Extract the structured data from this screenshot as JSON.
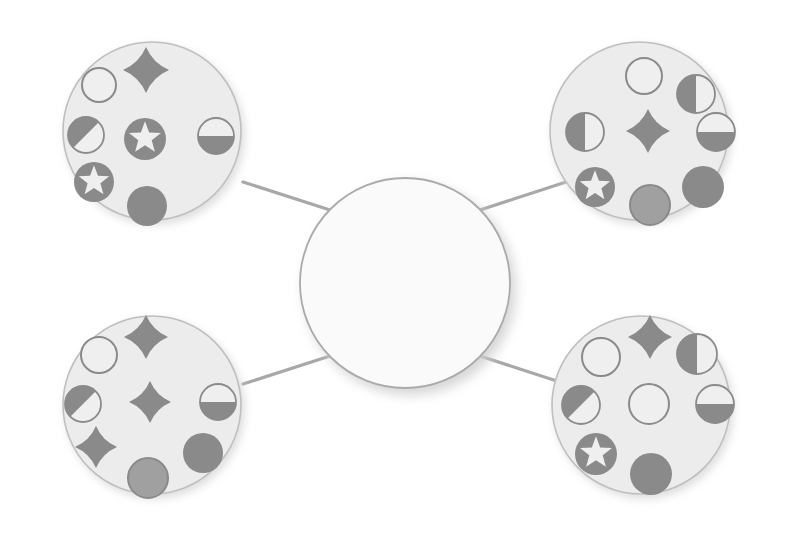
{
  "diagram": {
    "background_color": "#ffffff",
    "palette": {
      "cluster_fill": "#ececec",
      "cluster_stroke": "#bfbfbf",
      "hub_fill": "#fafafa",
      "hub_stroke": "#aaaaaa",
      "connector_stroke": "#a8a8a8",
      "glyph_dark": "#8a8a8a",
      "glyph_medium": "#a0a0a0",
      "glyph_light": "#efefef",
      "glyph_outline": "#8a8a8a",
      "shadow_color": "#e3e3e3"
    },
    "hub": {
      "label": "center-hub",
      "cx": 405,
      "cy": 283,
      "r": 105,
      "contents": "empty"
    },
    "connectors": [
      {
        "name": "connector-hub-to-top-left",
        "x1": 330,
        "y1": 210,
        "x2": 243,
        "y2": 182
      },
      {
        "name": "connector-hub-to-top-right",
        "x1": 480,
        "y1": 210,
        "x2": 566,
        "y2": 182
      },
      {
        "name": "connector-hub-to-bottom-left",
        "x1": 330,
        "y1": 356,
        "x2": 243,
        "y2": 384
      },
      {
        "name": "connector-hub-to-bottom-right",
        "x1": 480,
        "y1": 356,
        "x2": 566,
        "y2": 384
      }
    ],
    "clusters": [
      {
        "name": "cluster-top-left",
        "cx": 152,
        "cy": 131,
        "r": 89,
        "item_count": 7,
        "items": [
          {
            "glyph": "circle-outline-icon",
            "cx": 99,
            "cy": 85,
            "r": 17,
            "fill": "none",
            "shade": "light"
          },
          {
            "glyph": "four-pointed-star-icon",
            "cx": 146,
            "cy": 70,
            "r": 23,
            "fill": "solid",
            "shade": "dark"
          },
          {
            "glyph": "circle-half-diagonal-icon",
            "cx": 86,
            "cy": 135,
            "r": 18,
            "fill": "half-diagonal",
            "shade": "dark"
          },
          {
            "glyph": "star-in-circle-icon",
            "cx": 145,
            "cy": 139,
            "r": 21,
            "fill": "solid",
            "shade": "dark"
          },
          {
            "glyph": "circle-half-horizontal-icon",
            "cx": 216,
            "cy": 136,
            "r": 18,
            "fill": "half-bottom",
            "shade": "dark"
          },
          {
            "glyph": "star-in-circle-icon",
            "cx": 94,
            "cy": 182,
            "r": 20,
            "fill": "solid",
            "shade": "dark"
          },
          {
            "glyph": "circle-solid-icon",
            "cx": 147,
            "cy": 206,
            "r": 20,
            "fill": "solid",
            "shade": "dark"
          }
        ]
      },
      {
        "name": "cluster-top-right",
        "cx": 639,
        "cy": 131,
        "r": 89,
        "item_count": 7,
        "items": [
          {
            "glyph": "circle-outline-icon",
            "cx": 644,
            "cy": 76,
            "r": 18,
            "fill": "none",
            "shade": "light"
          },
          {
            "glyph": "circle-half-vertical-icon",
            "cx": 696,
            "cy": 94,
            "r": 19,
            "fill": "half-left",
            "shade": "dark"
          },
          {
            "glyph": "circle-half-vertical-icon",
            "cx": 585,
            "cy": 132,
            "r": 19,
            "fill": "half-left",
            "shade": "dark"
          },
          {
            "glyph": "four-pointed-star-icon",
            "cx": 648,
            "cy": 131,
            "r": 22,
            "fill": "solid",
            "shade": "dark"
          },
          {
            "glyph": "circle-half-horizontal-icon",
            "cx": 716,
            "cy": 132,
            "r": 19,
            "fill": "half-bottom",
            "shade": "dark"
          },
          {
            "glyph": "star-in-circle-icon",
            "cx": 595,
            "cy": 187,
            "r": 20,
            "fill": "solid",
            "shade": "dark"
          },
          {
            "glyph": "circle-solid-icon",
            "cx": 703,
            "cy": 187,
            "r": 21,
            "fill": "solid",
            "shade": "dark"
          },
          {
            "glyph": "circle-solid-outlined-icon",
            "cx": 650,
            "cy": 205,
            "r": 20,
            "fill": "solid",
            "shade": "medium"
          }
        ]
      },
      {
        "name": "cluster-bottom-left",
        "cx": 152,
        "cy": 405,
        "r": 89,
        "item_count": 7,
        "items": [
          {
            "glyph": "circle-outline-icon",
            "cx": 99,
            "cy": 355,
            "r": 18,
            "fill": "none",
            "shade": "light"
          },
          {
            "glyph": "four-pointed-star-icon",
            "cx": 146,
            "cy": 337,
            "r": 22,
            "fill": "solid",
            "shade": "dark"
          },
          {
            "glyph": "circle-half-diagonal-icon",
            "cx": 83,
            "cy": 404,
            "r": 18,
            "fill": "half-diagonal",
            "shade": "dark"
          },
          {
            "glyph": "four-pointed-star-icon",
            "cx": 150,
            "cy": 402,
            "r": 21,
            "fill": "solid",
            "shade": "dark"
          },
          {
            "glyph": "circle-half-horizontal-icon",
            "cx": 218,
            "cy": 402,
            "r": 18,
            "fill": "half-bottom",
            "shade": "dark"
          },
          {
            "glyph": "four-pointed-star-icon",
            "cx": 96,
            "cy": 447,
            "r": 21,
            "fill": "solid",
            "shade": "dark"
          },
          {
            "glyph": "circle-solid-icon",
            "cx": 203,
            "cy": 453,
            "r": 20,
            "fill": "solid",
            "shade": "dark"
          },
          {
            "glyph": "circle-solid-outlined-icon",
            "cx": 148,
            "cy": 478,
            "r": 20,
            "fill": "solid",
            "shade": "medium"
          }
        ]
      },
      {
        "name": "cluster-bottom-right",
        "cx": 641,
        "cy": 405,
        "r": 89,
        "item_count": 7,
        "items": [
          {
            "glyph": "circle-outline-icon",
            "cx": 601,
            "cy": 357,
            "r": 19,
            "fill": "none",
            "shade": "light"
          },
          {
            "glyph": "four-pointed-star-icon",
            "cx": 650,
            "cy": 337,
            "r": 22,
            "fill": "solid",
            "shade": "dark"
          },
          {
            "glyph": "circle-half-vertical-icon",
            "cx": 697,
            "cy": 354,
            "r": 20,
            "fill": "half-left",
            "shade": "dark"
          },
          {
            "glyph": "circle-half-diagonal-icon",
            "cx": 581,
            "cy": 405,
            "r": 19,
            "fill": "half-diagonal",
            "shade": "dark"
          },
          {
            "glyph": "circle-outline-icon",
            "cx": 649,
            "cy": 404,
            "r": 20,
            "fill": "none",
            "shade": "light"
          },
          {
            "glyph": "circle-half-horizontal-icon",
            "cx": 715,
            "cy": 404,
            "r": 19,
            "fill": "half-bottom",
            "shade": "dark"
          },
          {
            "glyph": "star-in-circle-icon",
            "cx": 596,
            "cy": 454,
            "r": 21,
            "fill": "solid",
            "shade": "dark"
          },
          {
            "glyph": "circle-solid-icon",
            "cx": 651,
            "cy": 474,
            "r": 21,
            "fill": "solid",
            "shade": "dark"
          }
        ]
      }
    ]
  }
}
